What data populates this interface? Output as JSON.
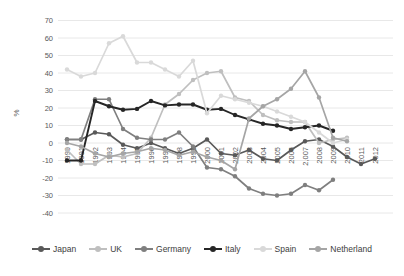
{
  "chart_data": {
    "type": "line",
    "title": "",
    "xlabel": "",
    "ylabel": "%",
    "ylim": [
      -40,
      70
    ],
    "ytick_step": 10,
    "grid": true,
    "legend_position": "bottom",
    "marker": "circle",
    "axis_text_color": "#595959",
    "gridline_color": "#e8e8e8",
    "background_color": "#ffffff",
    "categories": [
      "1990",
      "1991",
      "1992",
      "1993",
      "1994",
      "1995",
      "1996",
      "1997",
      "1998",
      "1999",
      "2000",
      "2001",
      "2002",
      "2003",
      "2004",
      "2005",
      "2006",
      "2,007",
      "2008",
      "2009",
      "2010",
      "2011",
      "2012"
    ],
    "series": [
      {
        "name": "Japan",
        "color": "#595959",
        "values": [
          2,
          2,
          6,
          5,
          -1,
          -3,
          0,
          -3,
          -6,
          -3,
          2,
          -6,
          -7,
          -4,
          -9,
          -10,
          -4,
          1,
          2,
          -2,
          -8,
          -12,
          -9
        ]
      },
      {
        "name": "UK",
        "color": "#bfbfbf",
        "values": [
          -4,
          -12,
          -12,
          -7,
          -8,
          -6,
          3,
          22,
          28,
          36,
          40,
          41,
          26,
          24,
          16,
          13,
          12,
          12,
          0,
          2,
          3,
          null,
          null
        ]
      },
      {
        "name": "Germany",
        "color": "#7f7f7f",
        "values": [
          2,
          2,
          25,
          25,
          8,
          3,
          2,
          2,
          6,
          -2,
          -14,
          -15,
          -19,
          -26,
          -29,
          -30,
          -29,
          -24,
          -27,
          -21,
          null,
          null,
          null
        ]
      },
      {
        "name": "Italy",
        "color": "#262626",
        "values": [
          -10,
          -10,
          24,
          21,
          19,
          19.5,
          24,
          21.5,
          22,
          22,
          19,
          19.5,
          16,
          13.5,
          11,
          10,
          8,
          9,
          10,
          7,
          null,
          null,
          null
        ]
      },
      {
        "name": "Spain",
        "color": "#d9d9d9",
        "values": [
          42,
          38,
          40,
          57,
          61,
          46,
          46,
          42,
          38,
          47,
          17,
          27,
          25,
          23,
          21,
          18,
          15,
          12,
          6,
          0,
          2,
          null,
          null
        ]
      },
      {
        "name": "Netherland",
        "color": "#a5a5a5",
        "values": [
          0,
          -2,
          -6,
          -8,
          -6,
          -5,
          -3,
          -4,
          -7,
          -5,
          -8,
          -10,
          -15,
          14,
          21,
          25,
          31,
          41,
          26,
          3,
          1,
          null,
          null
        ]
      }
    ]
  }
}
